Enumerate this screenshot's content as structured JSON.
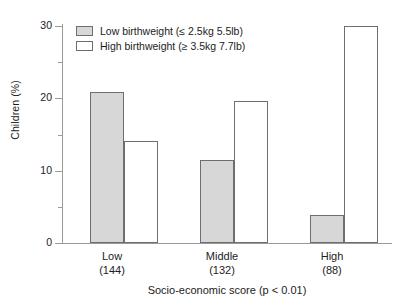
{
  "chart_data": {
    "type": "bar",
    "title": "",
    "subtitle": "",
    "xlabel": "Socio-economic score (p < 0.01)",
    "ylabel": "Children (%)",
    "categories": [
      "Low",
      "Middle",
      "High"
    ],
    "category_counts": [
      "(144)",
      "(132)",
      "(88)"
    ],
    "series": [
      {
        "name": "Low birthweight (≤ 2.5kg 5.5lb)",
        "fill": "#d7d7d7",
        "values": [
          20.9,
          11.5,
          3.9
        ]
      },
      {
        "name": "High birthweight (≥ 3.5kg 7.7lb)",
        "fill": "#ffffff",
        "values": [
          14.1,
          19.6,
          30.0
        ]
      }
    ],
    "ylim": [
      0,
      30
    ],
    "ytick_labels": [
      "0",
      "10",
      "20",
      "30"
    ],
    "ytick_values": [
      0,
      10,
      20,
      30
    ],
    "yminor_values": [
      5,
      15,
      25
    ],
    "grid": false,
    "legend_position": "top-left",
    "axis_color": "#9a9a9a",
    "bar_edge_color": "#6e6e6e",
    "text_color": "#1c1c1c"
  },
  "legend": {
    "items": [
      {
        "label": "Low birthweight (≤ 2.5kg 5.5lb)",
        "swatch": "gray"
      },
      {
        "label": "High birthweight (≥ 3.5kg 7.7lb)",
        "swatch": "white"
      }
    ]
  },
  "axes": {
    "y_title": "Children (%)",
    "x_title": "Socio-economic score (p < 0.01)",
    "y_ticks": [
      {
        "label": "30",
        "value": 30
      },
      {
        "label": "20",
        "value": 20
      },
      {
        "label": "10",
        "value": 10
      },
      {
        "label": "0",
        "value": 0
      }
    ]
  },
  "groups": [
    {
      "name": "Low",
      "count": "(144)",
      "gray": 20.9,
      "white": 14.1
    },
    {
      "name": "Middle",
      "count": "(132)",
      "gray": 11.5,
      "white": 19.6
    },
    {
      "name": "High",
      "count": "(88)",
      "gray": 3.9,
      "white": 30.0
    }
  ]
}
